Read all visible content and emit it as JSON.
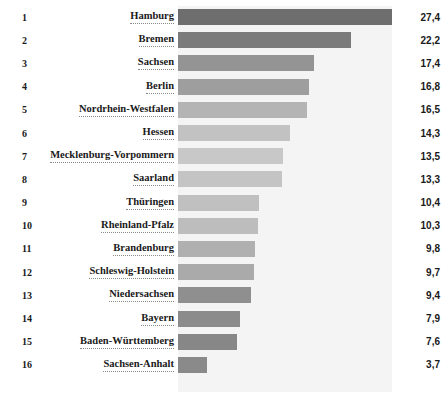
{
  "chart_data": {
    "type": "bar",
    "orientation": "horizontal",
    "title": "",
    "subtitle": "",
    "xlabel": "",
    "ylabel": "",
    "grid": false,
    "legend": null,
    "xlim": [
      0,
      27.4
    ],
    "decimal_separator": ",",
    "categories": [
      "Hamburg",
      "Bremen",
      "Sachsen",
      "Berlin",
      "Nordrhein-Westfalen",
      "Hessen",
      "Mecklenburg-Vorpommern",
      "Saarland",
      "Thüringen",
      "Rheinland-Pfalz",
      "Brandenburg",
      "Schleswig-Holstein",
      "Niedersachsen",
      "Bayern",
      "Baden-Württemberg",
      "Sachsen-Anhalt"
    ],
    "values": [
      27.4,
      22.2,
      17.4,
      16.8,
      16.5,
      14.3,
      13.5,
      13.3,
      10.4,
      10.3,
      9.8,
      9.7,
      9.4,
      7.9,
      7.6,
      3.7
    ],
    "value_labels": [
      "27,4",
      "22,2",
      "17,4",
      "16,8",
      "16,5",
      "14,3",
      "13,5",
      "13,3",
      "10,4",
      "10,3",
      "9,8",
      "9,7",
      "9,4",
      "7,9",
      "7,6",
      "3,7"
    ],
    "ranks": [
      "1",
      "2",
      "3",
      "4",
      "5",
      "6",
      "7",
      "8",
      "9",
      "10",
      "11",
      "12",
      "13",
      "14",
      "15",
      "16"
    ],
    "bar_colors": [
      "#6e6e6e",
      "#7b7b7b",
      "#949494",
      "#9e9e9e",
      "#b4b4b4",
      "#c2c2c2",
      "#c8c8c8",
      "#c4c4c4",
      "#c0c0c0",
      "#bdbdbd",
      "#b0b0b0",
      "#aaaaaa",
      "#8f8f8f",
      "#8b8b8b",
      "#878787",
      "#8a8a8a"
    ],
    "plot_background": "#f4f4f4",
    "text_color": "#1a1a1a"
  }
}
